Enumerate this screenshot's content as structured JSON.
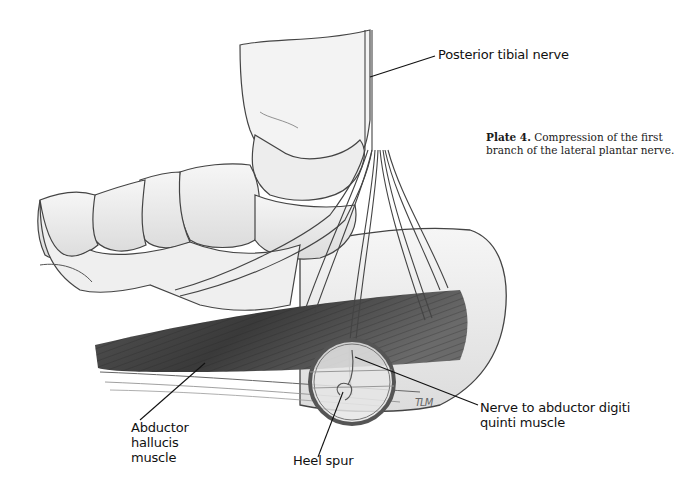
{
  "plate": {
    "number_label": "Plate 4.",
    "caption": "Compression of the first branch of the lateral plantar nerve.",
    "artist_initials": "TLM"
  },
  "labels": [
    {
      "id": "posterior-tibial-nerve",
      "text": "Posterior tibial nerve"
    },
    {
      "id": "nerve-to-abductor-digiti-quinti",
      "text": "Nerve to abductor digiti\nquinti muscle"
    },
    {
      "id": "abductor-hallucis",
      "text": "Abductor\nhallucis\nmuscle"
    },
    {
      "id": "heel-spur",
      "text": "Heel spur"
    }
  ],
  "colors": {
    "ink": "#3a3a3a",
    "muscle_dark": "#3d3d3d",
    "bone_fill": "#ececec",
    "background": "#ffffff"
  }
}
